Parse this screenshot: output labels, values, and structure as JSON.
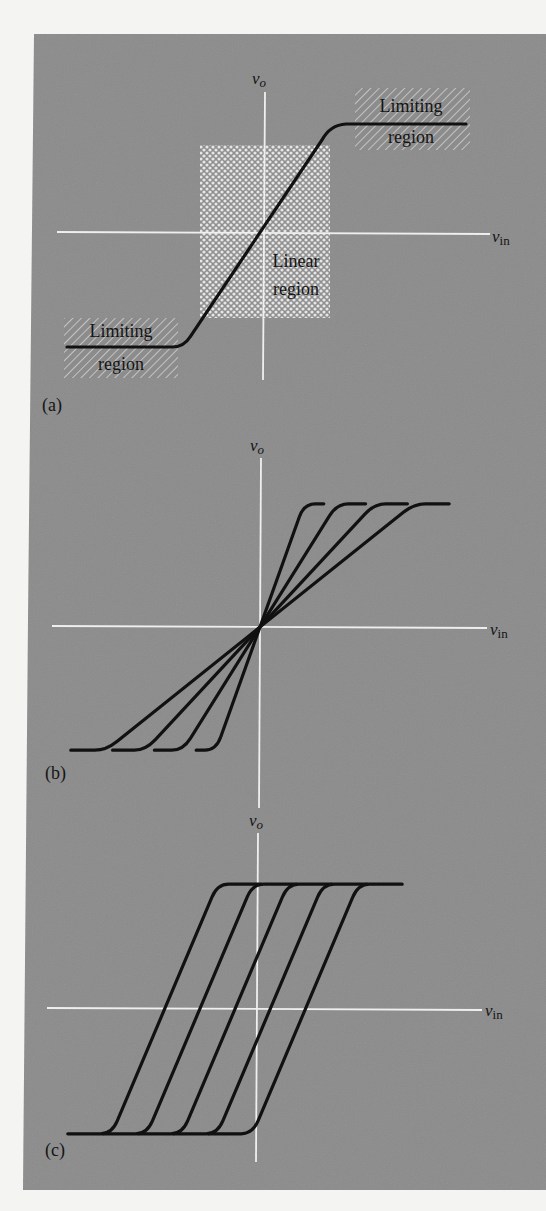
{
  "figure": {
    "panels": [
      {
        "id": "a",
        "label": "(a)",
        "y_axis_label": "v",
        "y_axis_sub": "o",
        "x_axis_label": "v",
        "x_axis_sub": "in",
        "regions": {
          "upper_limiting": [
            "Limiting",
            "region"
          ],
          "linear": [
            "Linear",
            "region"
          ],
          "lower_limiting": [
            "Limiting",
            "region"
          ]
        },
        "description": "Single transfer characteristic with linear region and two limiting regions"
      },
      {
        "id": "b",
        "label": "(b)",
        "y_axis_label": "v",
        "y_axis_sub": "o",
        "x_axis_label": "v",
        "x_axis_sub": "in",
        "description": "Four characteristics through origin with different gains",
        "curve_count": 4
      },
      {
        "id": "c",
        "label": "(c)",
        "y_axis_label": "v",
        "y_axis_sub": "o",
        "x_axis_label": "v",
        "x_axis_sub": "in",
        "description": "Five parallel characteristics with equal gain and different offsets",
        "curve_count": 5
      }
    ],
    "colors": {
      "panel_bg": "#8a8a8a",
      "axis": "#efefef",
      "curve": "#111111",
      "page_bg": "#f4f4f2"
    }
  },
  "chart_data": [
    {
      "type": "line",
      "title": "(a)",
      "xlabel": "v_in",
      "ylabel": "v_o",
      "xlim": [
        -1,
        1
      ],
      "ylim": [
        -1,
        1
      ],
      "grid": false,
      "series": [
        {
          "name": "transfer",
          "x": [
            -0.9,
            -0.38,
            0.3,
            0.92
          ],
          "y": [
            -0.8,
            -0.8,
            0.8,
            0.8
          ]
        }
      ],
      "annotations": [
        "Limiting region",
        "Linear region",
        "Limiting region"
      ]
    },
    {
      "type": "line",
      "title": "(b)",
      "xlabel": "v_in",
      "ylabel": "v_o",
      "xlim": [
        -1,
        1
      ],
      "ylim": [
        -1,
        1
      ],
      "grid": false,
      "series": [
        {
          "name": "gain-1",
          "x": [
            -0.29,
            -0.2,
            0.0,
            0.2,
            0.29
          ],
          "y": [
            -0.8,
            -0.8,
            0,
            0.8,
            0.8
          ]
        },
        {
          "name": "gain-2",
          "x": [
            -0.48,
            -0.35,
            0.0,
            0.35,
            0.48
          ],
          "y": [
            -0.8,
            -0.8,
            0,
            0.8,
            0.8
          ]
        },
        {
          "name": "gain-3",
          "x": [
            -0.67,
            -0.52,
            0.0,
            0.52,
            0.67
          ],
          "y": [
            -0.8,
            -0.8,
            0,
            0.8,
            0.8
          ]
        },
        {
          "name": "gain-4",
          "x": [
            -0.86,
            -0.7,
            0.0,
            0.7,
            0.86
          ],
          "y": [
            -0.8,
            -0.8,
            0,
            0.8,
            0.8
          ]
        }
      ]
    },
    {
      "type": "line",
      "title": "(c)",
      "xlabel": "v_in",
      "ylabel": "v_o",
      "xlim": [
        -1,
        1
      ],
      "ylim": [
        -1,
        1
      ],
      "grid": false,
      "series": [
        {
          "name": "offset-1",
          "offset": -0.42
        },
        {
          "name": "offset-2",
          "offset": -0.26
        },
        {
          "name": "offset-3",
          "offset": -0.1
        },
        {
          "name": "offset-4",
          "offset": 0.06
        },
        {
          "name": "offset-5",
          "offset": 0.22
        }
      ],
      "series_shape": {
        "half_width": 0.24,
        "flat_length": 0.2,
        "y_limit": 0.8
      }
    }
  ]
}
